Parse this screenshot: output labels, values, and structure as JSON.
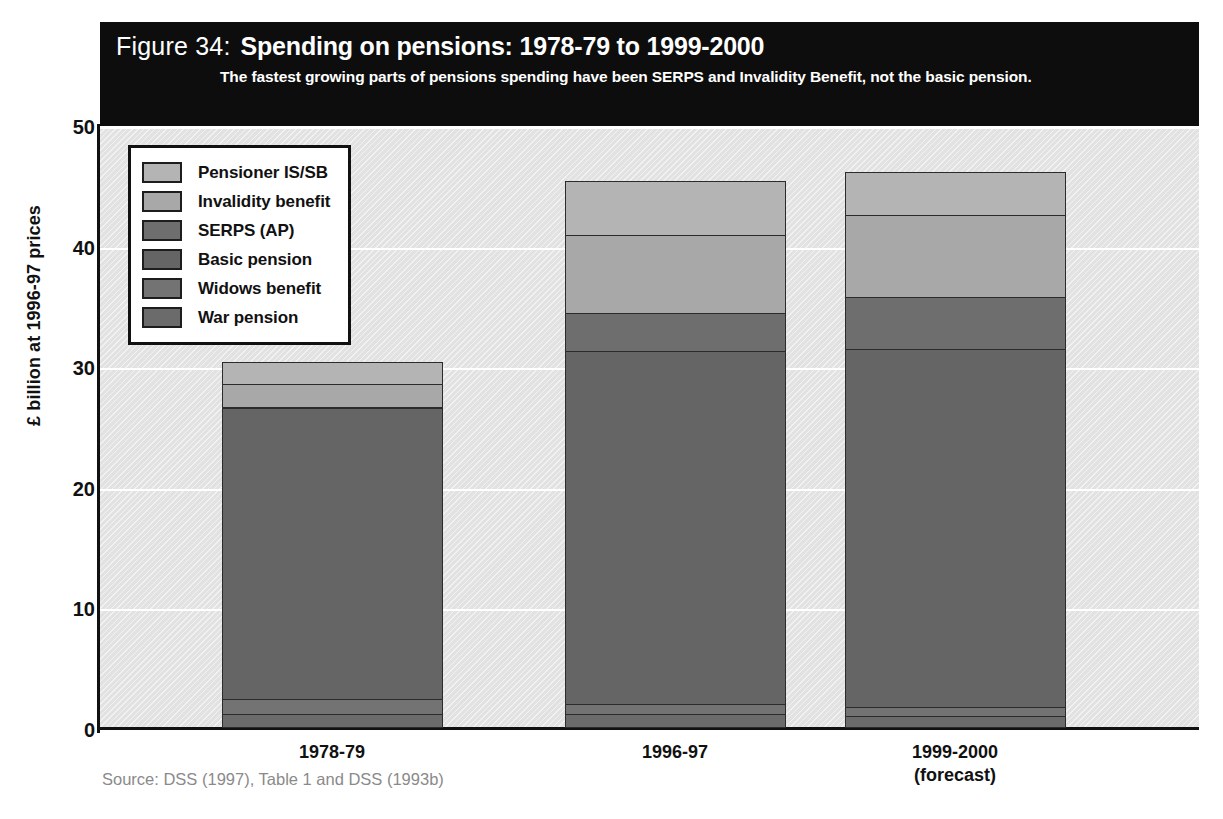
{
  "figure": {
    "number_label": "Figure 34:",
    "title": "Spending on pensions: 1978-79 to 1999-2000",
    "subtitle": "The fastest growing parts of pensions spending have been SERPS and Invalidity Benefit, not the basic pension.",
    "source": "Source: DSS (1997), Table 1 and DSS (1993b)"
  },
  "chart_data": {
    "type": "bar",
    "stacked": true,
    "title": "Spending on pensions: 1978-79 to 1999-2000",
    "subtitle": "The fastest growing parts of pensions spending have been SERPS and Invalidity Benefit, not the basic pension.",
    "xlabel": "",
    "ylabel": "£ billion at 1996-97 prices",
    "ylim": [
      0,
      50
    ],
    "yticks": [
      0,
      10,
      20,
      30,
      40,
      50
    ],
    "ytick_labels": [
      "0",
      "10",
      "20",
      "30",
      "40",
      "50"
    ],
    "grid": true,
    "legend_position": "upper-left-inside",
    "categories": [
      "1978-79",
      "1996-97",
      "1999-2000\n(forecast)"
    ],
    "category_labels": [
      {
        "line1": "1978-79",
        "line2": ""
      },
      {
        "line1": "1996-97",
        "line2": ""
      },
      {
        "line1": "1999-2000",
        "line2": "(forecast)"
      }
    ],
    "series": [
      {
        "name": "Pensioner IS/SB",
        "color": "#b4b4b4",
        "values": [
          1.9,
          4.6,
          3.6
        ]
      },
      {
        "name": "Invalidity benefit",
        "color": "#a8a8a8",
        "values": [
          2.0,
          6.5,
          6.9
        ]
      },
      {
        "name": "SERPS (AP)",
        "color": "#6e6e6e",
        "values": [
          0.2,
          3.3,
          4.4
        ]
      },
      {
        "name": "Basic pension",
        "color": "#656565",
        "values": [
          24.2,
          29.3,
          29.8
        ]
      },
      {
        "name": "Widows benefit",
        "color": "#737373",
        "values": [
          1.3,
          0.9,
          0.8
        ]
      },
      {
        "name": "War pension",
        "color": "#6b6b6b",
        "values": [
          1.2,
          1.2,
          1.0
        ]
      }
    ],
    "totals": [
      30.8,
      45.8,
      46.5
    ],
    "stack_order_bottom_to_top": [
      "War pension",
      "Widows benefit",
      "Basic pension",
      "SERPS (AP)",
      "Invalidity benefit",
      "Pensioner IS/SB"
    ]
  },
  "colors": {
    "title_band_background": "#0d0d0d",
    "title_band_text": "#ffffff",
    "plot_background": "#e2e2e2",
    "gridline": "#ffffff",
    "axis": "#111111",
    "source_text": "#8a8a8a"
  }
}
